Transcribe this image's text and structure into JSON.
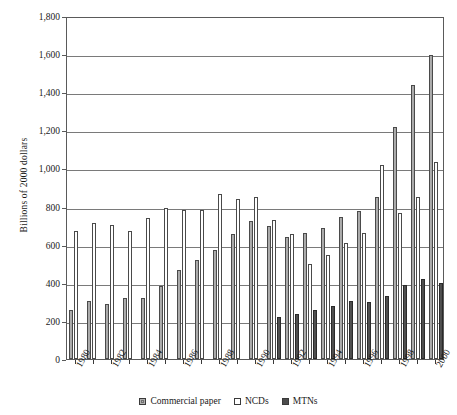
{
  "chart_data": {
    "type": "bar",
    "title": "",
    "subtitle": "",
    "xlabel": "",
    "ylabel": "Billions of 2000 dollars",
    "ylim": [
      0,
      1800
    ],
    "ytick_step": 200,
    "ytick_labels": [
      "0",
      "200",
      "400",
      "600",
      "800",
      "1,000",
      "1,200",
      "1,400",
      "1,600",
      "1,800"
    ],
    "ytick_values": [
      0,
      200,
      400,
      600,
      800,
      1000,
      1200,
      1400,
      1600,
      1800
    ],
    "grid": true,
    "legend_position": "bottom",
    "categories": [
      1980,
      1981,
      1982,
      1983,
      1984,
      1985,
      1986,
      1987,
      1988,
      1989,
      1990,
      1991,
      1992,
      1993,
      1994,
      1995,
      1996,
      1997,
      1998,
      1999,
      2000
    ],
    "xtick_labels": [
      "1980",
      "1982",
      "1984",
      "1986",
      "1988",
      "1990",
      "1992",
      "1994",
      "1996",
      "1998",
      "2000"
    ],
    "xtick_label_years": [
      1980,
      1982,
      1984,
      1986,
      1988,
      1990,
      1992,
      1994,
      1996,
      1998,
      2000
    ],
    "series": [
      {
        "name": "Commercial paper",
        "color": "#a8a8a8",
        "values": [
          255,
          305,
          288,
          318,
          320,
          385,
          465,
          520,
          570,
          655,
          725,
          700,
          640,
          660,
          690,
          745,
          775,
          850,
          1215,
          1440,
          1595
        ]
      },
      {
        "name": "NCDs",
        "color": "#ffffff",
        "values": [
          670,
          715,
          705,
          670,
          740,
          790,
          780,
          780,
          865,
          840,
          850,
          730,
          655,
          500,
          545,
          610,
          660,
          1020,
          765,
          850,
          1035
        ]
      },
      {
        "name": "MTNs",
        "color": "#4c4c4c",
        "values": [
          0,
          0,
          0,
          0,
          0,
          0,
          0,
          0,
          0,
          0,
          0,
          220,
          235,
          255,
          280,
          305,
          300,
          330,
          390,
          420,
          400
        ]
      }
    ]
  },
  "legend": {
    "entries": [
      {
        "label": "Commercial paper",
        "swatch": "cp"
      },
      {
        "label": "NCDs",
        "swatch": "ncd"
      },
      {
        "label": "MTNs",
        "swatch": "mtn"
      }
    ]
  }
}
